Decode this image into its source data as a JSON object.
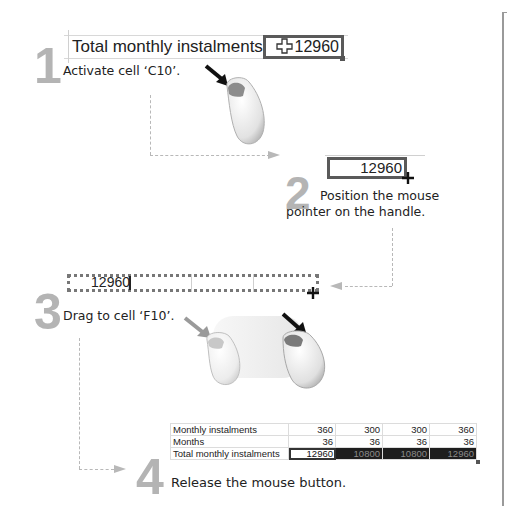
{
  "steps": [
    {
      "number": "1",
      "instruction": "Activate cell ‘C10’.",
      "cell_label": "Total monthly instalments",
      "cell_value": "12960",
      "cursor": "fat-cross"
    },
    {
      "number": "2",
      "instruction_line1": "Position the mouse",
      "instruction_line2": "pointer on the handle.",
      "cell_value": "12960",
      "cursor": "fill-handle-cross"
    },
    {
      "number": "3",
      "instruction": "Drag to cell ‘F10’.",
      "cell_value": "12960"
    },
    {
      "number": "4",
      "instruction": "Release the mouse button.",
      "table": {
        "rows": [
          {
            "label": "Monthly instalments",
            "values": [
              "360",
              "300",
              "300",
              "360"
            ]
          },
          {
            "label": "Months",
            "values": [
              "36",
              "36",
              "36",
              "36"
            ]
          },
          {
            "label": "Total monthly instalments",
            "values": [
              "12960",
              "10800",
              "10800",
              "12960"
            ]
          }
        ]
      }
    }
  ],
  "colors": {
    "step_number": "#b4b4b4",
    "border": "#9a9a9a",
    "selection": "#1e1e1e"
  }
}
